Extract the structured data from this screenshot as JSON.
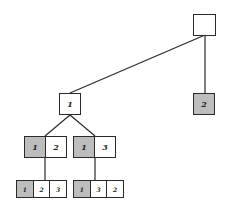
{
  "diagram": {
    "type": "permutation-tree",
    "colors": {
      "shaded": "#bdbdbd",
      "line": "#2a2a2a",
      "background": "#ffffff"
    },
    "nodes": [
      {
        "id": "root",
        "cells": [
          {
            "label": "",
            "shaded": false
          }
        ]
      },
      {
        "id": "n1",
        "cells": [
          {
            "label": "1",
            "shaded": false
          }
        ]
      },
      {
        "id": "n2",
        "cells": [
          {
            "label": "2",
            "shaded": true
          }
        ]
      },
      {
        "id": "n12",
        "cells": [
          {
            "label": "1",
            "shaded": true
          },
          {
            "label": "2",
            "shaded": false
          }
        ]
      },
      {
        "id": "n13",
        "cells": [
          {
            "label": "1",
            "shaded": true
          },
          {
            "label": "3",
            "shaded": false
          }
        ]
      },
      {
        "id": "n123",
        "cells": [
          {
            "label": "1",
            "shaded": true
          },
          {
            "label": "2",
            "shaded": false
          },
          {
            "label": "3",
            "shaded": false
          }
        ]
      },
      {
        "id": "n132",
        "cells": [
          {
            "label": "1",
            "shaded": true
          },
          {
            "label": "3",
            "shaded": false
          },
          {
            "label": "2",
            "shaded": false
          }
        ]
      }
    ],
    "edges": [
      [
        "root",
        "n1"
      ],
      [
        "root",
        "n2"
      ],
      [
        "n1",
        "n12"
      ],
      [
        "n1",
        "n13"
      ],
      [
        "n12",
        "n123"
      ],
      [
        "n13",
        "n132"
      ]
    ]
  }
}
